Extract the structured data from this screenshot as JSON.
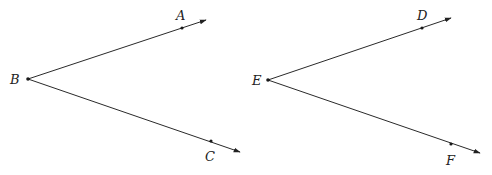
{
  "figure": {
    "width": 492,
    "height": 175,
    "ink_color": "#222222",
    "background": "#ffffff"
  },
  "angles": [
    {
      "name": "angle-ABC",
      "vertex": {
        "label": "B",
        "x": 28,
        "y": 79,
        "label_x": 10,
        "label_y": 84
      },
      "rays": [
        {
          "point": {
            "label": "A",
            "x": 182,
            "y": 28,
            "label_x": 176,
            "label_y": 20
          },
          "tip": {
            "x": 206,
            "y": 20
          }
        },
        {
          "point": {
            "label": "C",
            "x": 211,
            "y": 141,
            "label_x": 205,
            "label_y": 161
          },
          "tip": {
            "x": 240,
            "y": 152
          }
        }
      ]
    },
    {
      "name": "angle-DEF",
      "vertex": {
        "label": "E",
        "x": 268,
        "y": 80,
        "label_x": 252,
        "label_y": 85
      },
      "rays": [
        {
          "point": {
            "label": "D",
            "x": 422,
            "y": 28,
            "label_x": 417,
            "label_y": 20
          },
          "tip": {
            "x": 451,
            "y": 18
          }
        },
        {
          "point": {
            "label": "F",
            "x": 451,
            "y": 144,
            "label_x": 446,
            "label_y": 165
          },
          "tip": {
            "x": 480,
            "y": 153
          }
        }
      ]
    }
  ],
  "labels": {
    "A": "A",
    "B": "B",
    "C": "C",
    "D": "D",
    "E": "E",
    "F": "F"
  }
}
